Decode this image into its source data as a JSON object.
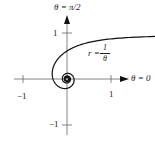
{
  "diagram": {
    "equation": {
      "lhs": "r =",
      "numerator": "1",
      "denominator": "θ"
    },
    "axis_labels": {
      "top": "θ = π/2",
      "right": "θ = 0"
    },
    "ticks": {
      "x_pos": "1",
      "x_neg": "−1",
      "y_pos": "1",
      "y_neg": "−1"
    },
    "colors": {
      "curve": "#111111",
      "axis": "#555555"
    }
  }
}
